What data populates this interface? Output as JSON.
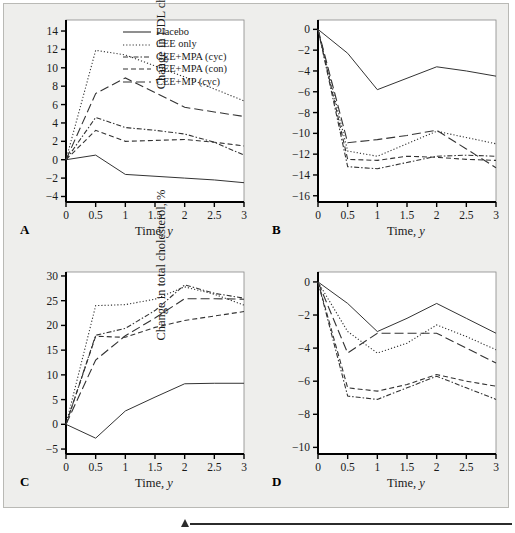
{
  "figure": {
    "background_color": "#eeeeec",
    "line_color": "#333333",
    "axis_color": "#000000"
  },
  "legend": {
    "position": "top-right of panel A",
    "entries": [
      {
        "label": "Placebo",
        "dash": "solid"
      },
      {
        "label": "CEE only",
        "dash": "dotted"
      },
      {
        "label": "CEE+MPA (cyc)",
        "dash": "dash-dot"
      },
      {
        "label": "CEE+MPA (con)",
        "dash": "dashed"
      },
      {
        "label": "CEE+MP (cyc)",
        "dash": "long-dash"
      }
    ]
  },
  "panels": [
    {
      "letter": "A",
      "key": "hdl"
    },
    {
      "letter": "B",
      "key": "ldl"
    },
    {
      "letter": "C",
      "key": "tg"
    },
    {
      "letter": "D",
      "key": "total"
    }
  ],
  "chart_data": [
    {
      "type": "line",
      "panel": "A",
      "title": "",
      "xlabel": "Time, y",
      "ylabel": "Change in HDL cholesterol, %",
      "x": [
        0,
        0.5,
        1,
        1.5,
        2,
        2.5,
        3
      ],
      "xticks": [
        "0",
        "0.5",
        "1",
        "1.5",
        "2",
        "2.5",
        "3"
      ],
      "xlim": [
        0,
        3
      ],
      "ylim": [
        -4.6,
        15.2
      ],
      "yticks": [
        -4,
        -2,
        0,
        2,
        4,
        6,
        8,
        10,
        12,
        14
      ],
      "grid": false,
      "series": [
        {
          "name": "Placebo",
          "dash": "solid",
          "values": [
            0,
            0.5,
            -1.6,
            -1.8,
            -2.0,
            -2.2,
            -2.5
          ]
        },
        {
          "name": "CEE only",
          "dash": "dotted",
          "values": [
            0,
            11.9,
            11.4,
            10.2,
            9.0,
            7.7,
            6.4
          ]
        },
        {
          "name": "CEE+MPA (cyc)",
          "dash": "dash-dot",
          "values": [
            0,
            4.6,
            3.5,
            3.2,
            2.8,
            1.9,
            0.5
          ]
        },
        {
          "name": "CEE+MPA (con)",
          "dash": "dashed",
          "values": [
            0,
            3.2,
            2.0,
            2.1,
            2.2,
            1.9,
            1.5
          ]
        },
        {
          "name": "CEE+MP (cyc)",
          "dash": "long-dash",
          "values": [
            0,
            7.2,
            8.9,
            7.3,
            5.7,
            5.2,
            4.7
          ]
        }
      ]
    },
    {
      "type": "line",
      "panel": "B",
      "title": "",
      "xlabel": "Time, y",
      "ylabel": "Change in LDL cholesterol, %",
      "x": [
        0,
        0.5,
        1,
        1.5,
        2,
        2.5,
        3
      ],
      "xticks": [
        "0",
        "0.5",
        "1",
        "1.5",
        "2",
        "2.5",
        "3"
      ],
      "xlim": [
        0,
        3
      ],
      "ylim": [
        -16.6,
        0.9
      ],
      "yticks": [
        -16,
        -14,
        -12,
        -10,
        -8,
        -6,
        -4,
        -2,
        0
      ],
      "grid": false,
      "series": [
        {
          "name": "Placebo",
          "dash": "solid",
          "values": [
            0,
            -2.3,
            -5.8,
            -4.7,
            -3.6,
            -4.0,
            -4.5
          ]
        },
        {
          "name": "CEE only",
          "dash": "dotted",
          "values": [
            0,
            -11.7,
            -12.2,
            -11.0,
            -9.8,
            -10.4,
            -11.0
          ]
        },
        {
          "name": "CEE+MPA (cyc)",
          "dash": "dash-dot",
          "values": [
            0,
            -13.2,
            -13.4,
            -12.8,
            -12.2,
            -12.1,
            -12.2
          ]
        },
        {
          "name": "CEE+MPA (con)",
          "dash": "dashed",
          "values": [
            0,
            -12.5,
            -12.6,
            -12.2,
            -12.3,
            -12.5,
            -12.6
          ]
        },
        {
          "name": "CEE+MP (cyc)",
          "dash": "long-dash",
          "values": [
            0,
            -10.9,
            -10.6,
            -10.2,
            -9.7,
            -11.5,
            -13.3
          ]
        }
      ]
    },
    {
      "type": "line",
      "panel": "C",
      "title": "",
      "xlabel": "Time, y",
      "ylabel": "Change in triglycerides, %",
      "x": [
        0,
        0.5,
        1,
        1.5,
        2,
        2.5,
        3
      ],
      "xticks": [
        "0",
        "0.5",
        "1",
        "1.5",
        "2",
        "2.5",
        "3"
      ],
      "xlim": [
        0,
        3
      ],
      "ylim": [
        -6.0,
        30.8
      ],
      "yticks": [
        -5,
        0,
        5,
        10,
        15,
        20,
        25,
        30
      ],
      "grid": false,
      "series": [
        {
          "name": "Placebo",
          "dash": "solid",
          "values": [
            0,
            -2.8,
            2.7,
            5.5,
            8.2,
            8.3,
            8.3
          ]
        },
        {
          "name": "CEE only",
          "dash": "dotted",
          "values": [
            0,
            24.0,
            24.2,
            25.3,
            27.8,
            26.3,
            24.1
          ]
        },
        {
          "name": "CEE+MPA (cyc)",
          "dash": "dash-dot",
          "values": [
            0,
            18.0,
            19.4,
            23.0,
            28.2,
            26.5,
            25.5
          ]
        },
        {
          "name": "CEE+MPA (con)",
          "dash": "dashed",
          "values": [
            0,
            17.8,
            17.6,
            19.6,
            21.0,
            21.9,
            22.8
          ]
        },
        {
          "name": "CEE+MP (cyc)",
          "dash": "long-dash",
          "values": [
            0,
            13.0,
            17.9,
            21.5,
            25.4,
            25.4,
            25.3
          ]
        }
      ]
    },
    {
      "type": "line",
      "panel": "D",
      "title": "",
      "xlabel": "Time, y",
      "ylabel": "Change in total cholesterol, %",
      "x": [
        0,
        0.5,
        1,
        1.5,
        2,
        2.5,
        3
      ],
      "xticks": [
        "0",
        "0.5",
        "1",
        "1.5",
        "2",
        "2.5",
        "3"
      ],
      "xlim": [
        0,
        3
      ],
      "ylim": [
        -10.4,
        0.6
      ],
      "yticks": [
        -10,
        -8,
        -6,
        -4,
        -2,
        0
      ],
      "grid": false,
      "series": [
        {
          "name": "Placebo",
          "dash": "solid",
          "values": [
            0,
            -1.3,
            -3.0,
            -2.2,
            -1.3,
            -2.2,
            -3.1
          ]
        },
        {
          "name": "CEE only",
          "dash": "dotted",
          "values": [
            0,
            -3.0,
            -4.3,
            -3.7,
            -2.6,
            -3.3,
            -4.1
          ]
        },
        {
          "name": "CEE+MPA (cyc)",
          "dash": "dash-dot",
          "values": [
            0,
            -6.9,
            -7.1,
            -6.4,
            -5.7,
            -6.4,
            -7.1
          ]
        },
        {
          "name": "CEE+MPA (con)",
          "dash": "dashed",
          "values": [
            0,
            -6.4,
            -6.6,
            -6.2,
            -5.6,
            -6.0,
            -6.3
          ]
        },
        {
          "name": "CEE+MP (cyc)",
          "dash": "long-dash",
          "values": [
            0,
            -4.3,
            -3.1,
            -3.1,
            -3.1,
            -4.0,
            -4.9
          ]
        }
      ]
    }
  ]
}
